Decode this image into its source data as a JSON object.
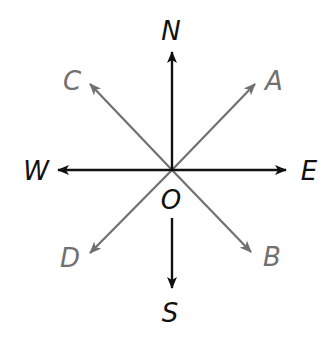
{
  "diagram": {
    "type": "compass-rose-rays",
    "center": {
      "label": "O",
      "x": 172,
      "y": 170
    },
    "colors": {
      "primary": "#111111",
      "secondary": "#707070",
      "background": "#ffffff"
    },
    "cardinal_rays": [
      {
        "id": "N",
        "label": "N",
        "from": [
          172,
          170
        ],
        "to": [
          172,
          52
        ],
        "label_pos": [
          171,
          40
        ]
      },
      {
        "id": "S",
        "label": "S",
        "from": [
          172,
          218
        ],
        "to": [
          172,
          288
        ],
        "label_pos": [
          170,
          322
        ]
      },
      {
        "id": "W",
        "label": "W",
        "from": [
          172,
          170
        ],
        "to": [
          58,
          170
        ],
        "label_pos": [
          36,
          180
        ]
      },
      {
        "id": "E",
        "label": "E",
        "from": [
          172,
          170
        ],
        "to": [
          286,
          170
        ],
        "label_pos": [
          309,
          180
        ]
      }
    ],
    "diagonal_rays": [
      {
        "id": "A",
        "label": "A",
        "from": [
          172,
          170
        ],
        "to": [
          255,
          84
        ],
        "label_pos": [
          274,
          90
        ]
      },
      {
        "id": "C",
        "label": "C",
        "from": [
          172,
          170
        ],
        "to": [
          90,
          84
        ],
        "label_pos": [
          72,
          90
        ]
      },
      {
        "id": "D",
        "label": "D",
        "from": [
          172,
          170
        ],
        "to": [
          90,
          253
        ],
        "label_pos": [
          70,
          267
        ]
      },
      {
        "id": "B",
        "label": "B",
        "from": [
          172,
          170
        ],
        "to": [
          251,
          252
        ],
        "label_pos": [
          272,
          266
        ]
      }
    ]
  }
}
